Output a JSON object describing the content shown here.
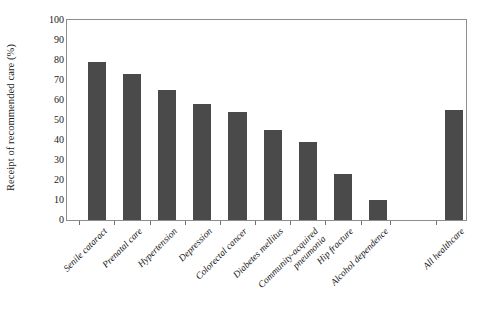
{
  "chart_data": {
    "type": "bar",
    "title": "",
    "xlabel": "",
    "ylabel": "Receipt of recommended care (%)",
    "ylim": [
      0,
      100
    ],
    "ytick_step": 10,
    "grid": false,
    "legend": "none",
    "bar_color": "#4a4a4a",
    "frame_color": "#8d8d8d",
    "categories": [
      "Senile cataract",
      "Prenatal care",
      "Hypertension",
      "Depression",
      "Colorectal cancer",
      "Diabetes mellitus",
      "Community-acquired pneumonia",
      "Hip fracture",
      "Alcohol dependence",
      "All healthcare"
    ],
    "category_lines": [
      [
        "Senile cataract"
      ],
      [
        "Prenatal care"
      ],
      [
        "Hypertension"
      ],
      [
        "Depression"
      ],
      [
        "Colorectal cancer"
      ],
      [
        "Diabetes mellitus"
      ],
      [
        "Community-acquired",
        "pneumonia"
      ],
      [
        "Hip fracture"
      ],
      [
        "Alcohol dependence"
      ],
      [
        "All healthcare"
      ]
    ],
    "values": [
      79,
      73,
      65,
      58,
      54,
      45,
      39,
      23,
      10,
      55
    ],
    "yticks": [
      0,
      10,
      20,
      30,
      40,
      50,
      60,
      70,
      80,
      90,
      100
    ],
    "ytick_labels": [
      "0",
      "10",
      "20",
      "30",
      "40",
      "50",
      "60",
      "70",
      "80",
      "90",
      "100"
    ]
  }
}
